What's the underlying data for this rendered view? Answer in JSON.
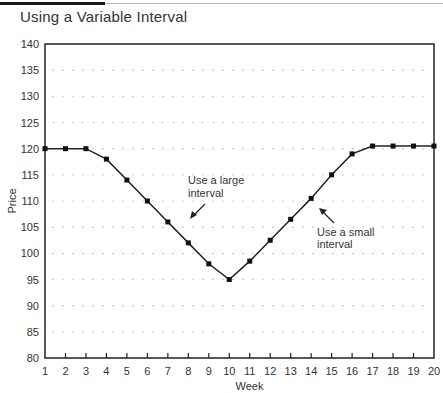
{
  "title": "Using a Variable Interval",
  "chart_data": {
    "type": "line",
    "title": "Using a Variable Interval",
    "xlabel": "Week",
    "ylabel": "Price",
    "x": [
      1,
      2,
      3,
      4,
      5,
      6,
      7,
      8,
      9,
      10,
      11,
      12,
      13,
      14,
      15,
      16,
      17,
      18,
      19,
      20
    ],
    "series": [
      {
        "name": "Price",
        "values": [
          120,
          120,
          120,
          118,
          114,
          110,
          106,
          102,
          98,
          95,
          98.5,
          102.5,
          106.5,
          110.5,
          115,
          119,
          120.5,
          120.5,
          120.5,
          120.5
        ]
      }
    ],
    "xlim": [
      1,
      20
    ],
    "ylim": [
      80,
      140
    ],
    "yticks": [
      80,
      85,
      90,
      95,
      100,
      105,
      110,
      115,
      120,
      125,
      130,
      135,
      140
    ],
    "xticks": [
      1,
      2,
      3,
      4,
      5,
      6,
      7,
      8,
      9,
      10,
      11,
      12,
      13,
      14,
      15,
      16,
      17,
      18,
      19,
      20
    ],
    "grid": "dotted",
    "legend": "none",
    "annotations": [
      {
        "text": [
          "Use a large",
          "interval"
        ],
        "points_to_week": 7.5
      },
      {
        "text": [
          "Use a small",
          "interval"
        ],
        "points_to_week": 14.5
      }
    ]
  }
}
